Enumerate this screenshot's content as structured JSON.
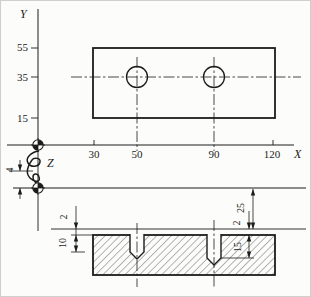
{
  "figure": {
    "axis_labels": {
      "x": "X",
      "y": "Y",
      "z": "Z"
    },
    "top_view": {
      "y_ticks": [
        "55",
        "35",
        "15"
      ],
      "x_ticks": [
        "30",
        "50",
        "90",
        "120"
      ]
    },
    "dims": {
      "d4": "4",
      "d2_left": "2",
      "d10": "10",
      "d25": "25",
      "d2_right": "2",
      "d15": "15"
    }
  }
}
